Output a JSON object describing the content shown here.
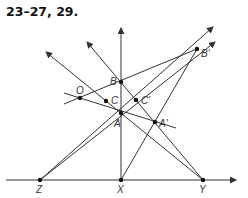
{
  "title": "23–27, 29.",
  "points": {
    "O": {
      "label": "O",
      "x": 80,
      "y": 98
    },
    "A": {
      "label": "A",
      "x": 121,
      "y": 113
    },
    "B": {
      "label": "B",
      "x": 121,
      "y": 82
    },
    "C": {
      "label": "C",
      "x": 106,
      "y": 101
    },
    "A_prime": {
      "label": "A′",
      "x": 155,
      "y": 122
    },
    "B_prime": {
      "label": "B′",
      "x": 197,
      "y": 49
    },
    "C_prime": {
      "label": "C′",
      "x": 136,
      "y": 100
    },
    "X": {
      "label": "X",
      "x": 121,
      "y": 180
    },
    "Y": {
      "label": "Y",
      "x": 203,
      "y": 180
    },
    "Z": {
      "label": "Z",
      "x": 40,
      "y": 180
    }
  },
  "colors": {
    "line": "#333333",
    "point": "#111111"
  }
}
